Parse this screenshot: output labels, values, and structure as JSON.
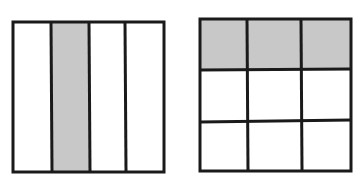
{
  "figures": [
    {
      "name": "fraction-bar-one-fourth",
      "layout": "4 vertical strips",
      "columns": 4,
      "rows": 1,
      "shaded_cells": [
        [
          0,
          1
        ]
      ],
      "fraction": "1/4"
    },
    {
      "name": "fraction-grid-three-ninths",
      "layout": "3x3 grid",
      "columns": 3,
      "rows": 3,
      "shaded_cells": [
        [
          0,
          0
        ],
        [
          0,
          1
        ],
        [
          0,
          2
        ]
      ],
      "fraction": "3/9"
    }
  ],
  "colors": {
    "shade": "#c8c8c8",
    "stroke": "#1a1a1a",
    "background": "#ffffff"
  }
}
